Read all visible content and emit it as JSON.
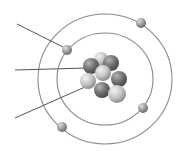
{
  "diagram": {
    "type": "atom-model",
    "colors": {
      "orbit": "#8a8a8a",
      "leader_line": "#555555",
      "electron": "#9a9a9a",
      "nucleus_dark": "#6e6e6e",
      "nucleus_light": "#c8c8c8",
      "background": "#ffffff"
    },
    "orbits": [
      {
        "name": "inner-shell",
        "cx": 105,
        "cy": 79,
        "rx": 48,
        "ry": 46
      },
      {
        "name": "outer-shell",
        "cx": 105,
        "cy": 79,
        "rx": 67,
        "ry": 65
      }
    ],
    "electrons": [
      {
        "name": "electron-outer-top-right",
        "x": 141,
        "y": 23
      },
      {
        "name": "electron-inner-top-left",
        "x": 67,
        "y": 50
      },
      {
        "name": "electron-inner-bottom-right",
        "x": 143,
        "y": 108
      },
      {
        "name": "electron-outer-bottom-left",
        "x": 62,
        "y": 127
      }
    ],
    "nucleons": [
      {
        "x": 101,
        "y": 59,
        "r": 7,
        "tone": "light"
      },
      {
        "x": 91,
        "y": 66,
        "r": 8,
        "tone": "dark"
      },
      {
        "x": 111,
        "y": 63,
        "r": 8,
        "tone": "dark"
      },
      {
        "x": 103,
        "y": 73,
        "r": 8,
        "tone": "light"
      },
      {
        "x": 119,
        "y": 79,
        "r": 8,
        "tone": "dark"
      },
      {
        "x": 102,
        "y": 90,
        "r": 8,
        "tone": "dark"
      },
      {
        "x": 88,
        "y": 81,
        "r": 8,
        "tone": "light"
      },
      {
        "x": 117,
        "y": 94,
        "r": 9,
        "tone": "light"
      }
    ],
    "leader_lines": [
      {
        "name": "label-line-electron",
        "x1": 17,
        "y1": 24,
        "x2": 63,
        "y2": 47
      },
      {
        "name": "label-line-neutron",
        "x1": 15,
        "y1": 70,
        "x2": 87,
        "y2": 68
      },
      {
        "name": "label-line-proton",
        "x1": 15,
        "y1": 118,
        "x2": 85,
        "y2": 87
      }
    ]
  }
}
